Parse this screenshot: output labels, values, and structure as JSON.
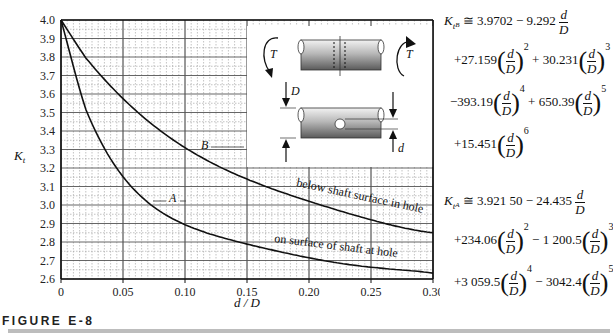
{
  "figure": {
    "caption": "FIGURE E-8"
  },
  "axes": {
    "ylabel_main": "K",
    "ylabel_sub": "t",
    "xlabel": "d / D",
    "y_ticks": [
      "4.0",
      "3.9",
      "3.8",
      "3.7",
      "3.6",
      "3.5",
      "3.4",
      "3.3",
      "3.2",
      "3.1",
      "3.0",
      "2.9",
      "2.8",
      "2.7",
      "2.6"
    ],
    "x_ticks": [
      "0",
      "0.05",
      "0.10",
      "0.15",
      "0.20",
      "0.25",
      "0.30"
    ]
  },
  "curves": {
    "B_label": "B",
    "A_label": "A",
    "B_annotation": "below shaft surface in hole",
    "A_annotation": "on surface of shaft at hole"
  },
  "inset": {
    "torque_left": "T",
    "torque_right": "T",
    "diameter_big": "D",
    "diameter_small": "d"
  },
  "equations": {
    "B": {
      "lhs_k": "K",
      "lhs_sub": "t",
      "lhs_subsub": "B",
      "line1": "≅ 3.9702 − 9.292",
      "line2_c1": "+27.159",
      "line2_p1": "2",
      "line2_c2": "+ 30.231",
      "line2_p2": "3",
      "line3_c1": "−393.19",
      "line3_p1": "4",
      "line3_c2": "+ 650.39",
      "line3_p2": "5",
      "line4_c1": "+15.451",
      "line4_p1": "6"
    },
    "A": {
      "lhs_k": "K",
      "lhs_sub": "t",
      "lhs_subsub": "A",
      "line1": "≅ 3.921 50 − 24.435",
      "line2_c1": "+234.06",
      "line2_p1": "2",
      "line2_c2": "− 1 200.5",
      "line2_p2": "3",
      "line3_c1": "+3 059.5",
      "line3_p1": "4",
      "line3_c2": "− 3042.4",
      "line3_p2": "5"
    },
    "frac_num": "d",
    "frac_den": "D"
  },
  "chart_data": {
    "type": "line",
    "xlabel": "d / D",
    "ylabel": "Kt",
    "xlim": [
      0,
      0.3
    ],
    "ylim": [
      2.6,
      4.0
    ],
    "grid": true,
    "x": [
      0,
      0.025,
      0.05,
      0.075,
      0.1,
      0.125,
      0.15,
      0.175,
      0.2,
      0.225,
      0.25,
      0.275,
      0.3
    ],
    "series": [
      {
        "name": "B — below shaft surface in hole",
        "values": [
          4.0,
          3.75,
          3.575,
          3.43,
          3.31,
          3.215,
          3.14,
          3.075,
          3.02,
          2.97,
          2.92,
          2.885,
          2.85
        ]
      },
      {
        "name": "A — on surface of shaft at hole",
        "values": [
          4.0,
          3.44,
          3.153,
          2.99,
          2.894,
          2.835,
          2.789,
          2.75,
          2.715,
          2.688,
          2.664,
          2.647,
          2.632
        ]
      }
    ],
    "annotations": [
      "below shaft surface in hole",
      "on surface of shaft at hole",
      "A",
      "B"
    ],
    "legend": "none (curves labeled inline)"
  }
}
